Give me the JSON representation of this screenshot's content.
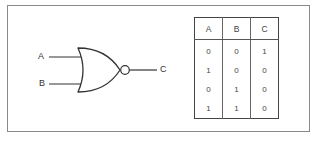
{
  "diagram": {
    "type": "NOR gate",
    "inputs": [
      {
        "label": "A"
      },
      {
        "label": "B"
      }
    ],
    "output": {
      "label": "C"
    },
    "colors": {
      "stroke": "#333333",
      "frame": "#8a8a8a"
    }
  },
  "truth_table": {
    "headers": [
      "A",
      "B",
      "C"
    ],
    "rows": [
      [
        "0",
        "0",
        "1"
      ],
      [
        "1",
        "0",
        "0"
      ],
      [
        "0",
        "1",
        "0"
      ],
      [
        "1",
        "1",
        "0"
      ]
    ]
  }
}
